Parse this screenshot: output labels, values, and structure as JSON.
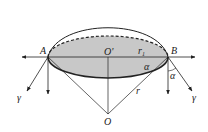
{
  "diagram": {
    "type": "geometry-physics",
    "labels": {
      "A": "A",
      "B": "B",
      "O_prime": "O'",
      "O": "O",
      "r1": "r",
      "r1_sub": "1",
      "r": "r",
      "alpha_inner": "α",
      "alpha_outer": "α",
      "gamma_left": "γ",
      "gamma_right": "γ"
    },
    "colors": {
      "stroke": "#222222",
      "fill_shaded": "#c8c8c8",
      "background": "#ffffff"
    }
  }
}
